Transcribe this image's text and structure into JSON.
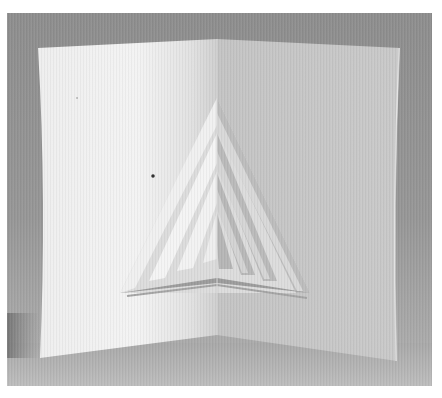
{
  "image": {
    "subject": "white paper pop-up card with triangular tree-like cutout",
    "colors": {
      "border": "#ffffff",
      "background_top": "#8e8e8e",
      "background_bottom": "#b2b2b2",
      "left_panel_light": "#f2f2f2",
      "left_panel_shadow": "#d8d8d8",
      "right_panel": "#c6c6c6",
      "floor": "#b5b5b5"
    }
  }
}
